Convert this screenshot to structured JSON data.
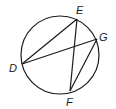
{
  "diagram": {
    "type": "circle-with-chords",
    "circle": {
      "cx": 60,
      "cy": 55,
      "r": 39
    },
    "points": {
      "D": {
        "x": 22,
        "y": 64,
        "label": "D",
        "lx": 9,
        "ly": 72
      },
      "E": {
        "x": 77,
        "y": 19,
        "label": "E",
        "lx": 76,
        "ly": 14
      },
      "G": {
        "x": 97,
        "y": 39,
        "label": "G",
        "lx": 99,
        "ly": 41
      },
      "F": {
        "x": 70,
        "y": 91,
        "label": "F",
        "lx": 66,
        "ly": 106
      }
    },
    "segments": [
      [
        "D",
        "E"
      ],
      [
        "D",
        "G"
      ],
      [
        "E",
        "F"
      ],
      [
        "F",
        "G"
      ]
    ],
    "stroke_color": "#1a1a1a"
  }
}
